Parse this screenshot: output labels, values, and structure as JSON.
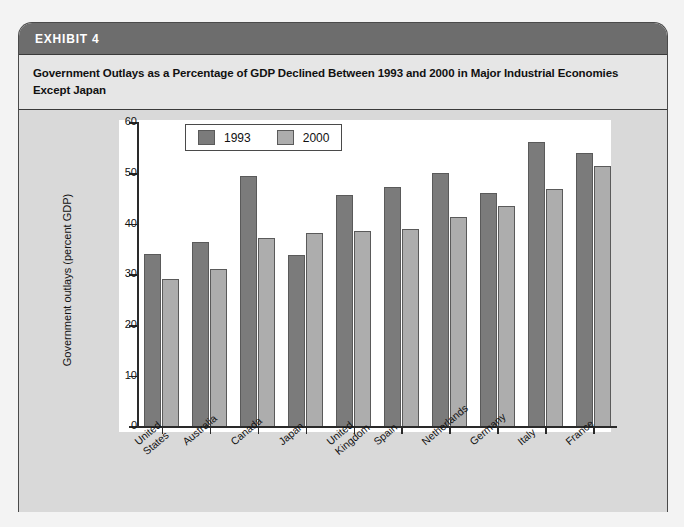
{
  "exhibit": {
    "label": "EXHIBIT 4",
    "subtitle": "Government Outlays as a Percentage of GDP Declined Between 1993 and 2000 in Major Industrial Economies Except Japan"
  },
  "colors": {
    "series_1993": "#7b7b7b",
    "series_2000": "#adadad",
    "titlebar": "#6d6d6d",
    "card_background": "#d9d9d9",
    "plot_background": "#ffffff",
    "axis": "#2a2a2a"
  },
  "chart_data": {
    "type": "bar",
    "title": "Government Outlays as a Percentage of GDP Declined Between 1993 and 2000 in Major Industrial Economies Except Japan",
    "xlabel": "",
    "ylabel": "Government outlays (percent GDP)",
    "ylim": [
      0,
      60
    ],
    "yticks": [
      0,
      10,
      20,
      30,
      40,
      50,
      60
    ],
    "ytick_labels": [
      "0",
      "10",
      "20",
      "30",
      "40",
      "50",
      "60"
    ],
    "grid": false,
    "legend_position": "top-center",
    "categories": [
      "United\nStates",
      "Australia",
      "Canada",
      "Japan",
      "United\nKingdom",
      "Spain",
      "Netherlands",
      "Germany",
      "Italy",
      "France"
    ],
    "series": [
      {
        "name": "1993",
        "color": "#7b7b7b",
        "values": [
          34.1,
          36.3,
          49.4,
          33.8,
          45.6,
          47.3,
          50.0,
          46.0,
          56.2,
          54.0
        ]
      },
      {
        "name": "2000",
        "color": "#adadad",
        "values": [
          29.1,
          31.1,
          37.2,
          38.2,
          38.6,
          38.9,
          41.3,
          43.5,
          46.9,
          51.4
        ]
      }
    ]
  }
}
